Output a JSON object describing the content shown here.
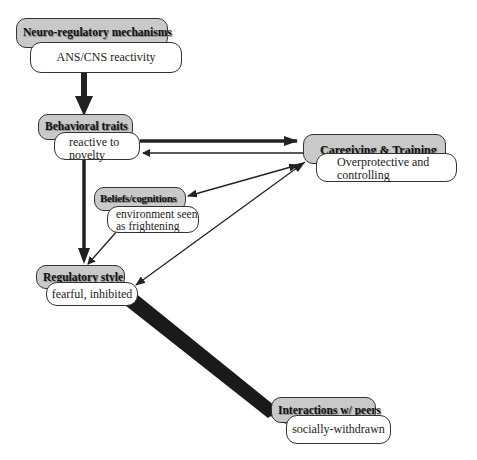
{
  "nodes": {
    "neuro": {
      "title": "Neuro-regulatory mechanisms",
      "text": "ANS/CNS reactivity"
    },
    "behavioral": {
      "title": "Behavioral traits",
      "text_line1": "reactive to",
      "text_line2": "novelty"
    },
    "caregiving": {
      "title": "Caregiving & Training",
      "text_line1": "Overprotective and",
      "text_line2": "controlling"
    },
    "beliefs": {
      "title": "Beliefs/cognitions",
      "text_line1": "environment seen",
      "text_line2": "as frightening"
    },
    "regulatory": {
      "title": "Regulatory style",
      "text": "fearful, inhibited"
    },
    "peers": {
      "title": "Interactions w/ peers",
      "text": "socially-withdrawn"
    }
  },
  "edges": [
    {
      "from": "neuro",
      "to": "behavioral",
      "weight": "heavy"
    },
    {
      "from": "behavioral",
      "to": "caregiving",
      "weight": "medium"
    },
    {
      "from": "caregiving",
      "to": "behavioral",
      "weight": "thin"
    },
    {
      "from": "behavioral",
      "to": "regulatory",
      "weight": "medium"
    },
    {
      "from": "caregiving",
      "to": "beliefs",
      "weight": "thin",
      "bidirectional": true
    },
    {
      "from": "caregiving",
      "to": "regulatory",
      "weight": "thin"
    },
    {
      "from": "beliefs",
      "to": "regulatory",
      "weight": "thin"
    },
    {
      "from": "regulatory",
      "to": "peers",
      "weight": "heaviest"
    }
  ],
  "colors": {
    "header_fill": "#c9c9c9",
    "line": "#222222",
    "body_fill": "#ffffff"
  }
}
